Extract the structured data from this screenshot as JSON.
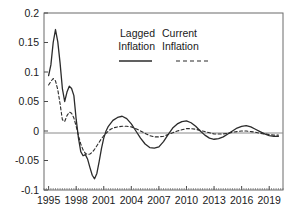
{
  "chart_data": {
    "type": "line",
    "title": "",
    "subtitle": "",
    "xlabel": "",
    "ylabel": "",
    "xlim": [
      1994.5,
      2020.5
    ],
    "ylim": [
      -0.1,
      0.2
    ],
    "grid": false,
    "zero_line": true,
    "legend_position": "top-center",
    "x_ticks": [
      "1995",
      "1998",
      "2001",
      "2004",
      "2007",
      "2010",
      "2013",
      "2016",
      "2019"
    ],
    "x_tick_values": [
      1995,
      1998,
      2001,
      2004,
      2007,
      2010,
      2013,
      2016,
      2019
    ],
    "y_ticks": [
      "0.2",
      "0.15",
      "0.1",
      "0.05",
      "0",
      "-0.05",
      "-0.1"
    ],
    "y_tick_values": [
      0.2,
      0.15,
      0.1,
      0.05,
      0,
      -0.05,
      -0.1
    ],
    "x": [
      1995.0,
      1995.25,
      1995.5,
      1995.75,
      1996.0,
      1996.25,
      1996.5,
      1996.75,
      1997.0,
      1997.25,
      1997.5,
      1997.75,
      1998.0,
      1998.25,
      1998.5,
      1998.75,
      1999.0,
      1999.25,
      1999.5,
      1999.75,
      2000.0,
      2000.25,
      2000.5,
      2000.75,
      2001.0,
      2001.25,
      2001.5,
      2001.75,
      2002.0,
      2002.5,
      2003.0,
      2003.5,
      2004.0,
      2004.5,
      2005.0,
      2005.5,
      2006.0,
      2006.5,
      2007.0,
      2007.5,
      2008.0,
      2008.5,
      2009.0,
      2009.5,
      2010.0,
      2010.5,
      2011.0,
      2011.5,
      2012.0,
      2012.5,
      2013.0,
      2013.5,
      2014.0,
      2014.5,
      2015.0,
      2015.5,
      2016.0,
      2016.5,
      2017.0,
      2017.5,
      2018.0,
      2018.5,
      2019.0,
      2019.5,
      2020.0
    ],
    "series": [
      {
        "name": "Lagged Inflation",
        "style": "solid",
        "color": "#2b2b2b",
        "values": [
          0.094,
          0.112,
          0.15,
          0.172,
          0.151,
          0.115,
          0.072,
          0.05,
          0.066,
          0.076,
          0.072,
          0.06,
          0.02,
          -0.012,
          -0.035,
          -0.042,
          -0.04,
          -0.048,
          -0.062,
          -0.075,
          -0.081,
          -0.072,
          -0.052,
          -0.03,
          -0.012,
          0.0,
          0.008,
          0.013,
          0.018,
          0.023,
          0.025,
          0.021,
          0.012,
          0.0,
          -0.012,
          -0.022,
          -0.028,
          -0.029,
          -0.027,
          -0.018,
          -0.006,
          0.005,
          0.012,
          0.016,
          0.017,
          0.014,
          0.008,
          0.0,
          -0.007,
          -0.012,
          -0.014,
          -0.013,
          -0.01,
          -0.005,
          0.0,
          0.005,
          0.008,
          0.009,
          0.007,
          0.003,
          -0.001,
          -0.005,
          -0.008,
          -0.009,
          -0.009
        ]
      },
      {
        "name": "Current Inflation",
        "style": "dashed",
        "color": "#2b2b2b",
        "values": [
          0.078,
          0.084,
          0.089,
          0.085,
          0.07,
          0.046,
          0.019,
          0.016,
          0.026,
          0.032,
          0.03,
          0.022,
          0.008,
          -0.008,
          -0.022,
          -0.032,
          -0.038,
          -0.04,
          -0.039,
          -0.036,
          -0.031,
          -0.025,
          -0.019,
          -0.013,
          -0.008,
          -0.004,
          0.0,
          0.003,
          0.005,
          0.007,
          0.008,
          0.008,
          0.007,
          0.004,
          0.0,
          -0.004,
          -0.008,
          -0.01,
          -0.01,
          -0.009,
          -0.006,
          -0.003,
          0.0,
          0.002,
          0.004,
          0.004,
          0.003,
          0.001,
          -0.001,
          -0.003,
          -0.005,
          -0.005,
          -0.005,
          -0.004,
          -0.002,
          -0.001,
          0.0,
          0.0,
          -0.001,
          -0.002,
          -0.004,
          -0.005,
          -0.006,
          -0.007,
          -0.007
        ]
      }
    ],
    "legend": [
      {
        "line1": "Lagged",
        "line2": "Inflation",
        "style": "solid"
      },
      {
        "line1": "Current",
        "line2": "Inflation",
        "style": "dashed"
      }
    ]
  }
}
